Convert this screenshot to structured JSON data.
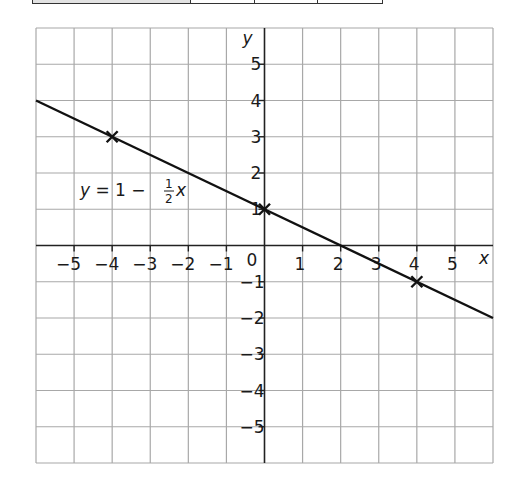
{
  "top_table": {
    "cells": [
      {
        "width": 159,
        "shaded": true
      },
      {
        "width": 64,
        "shaded": false
      },
      {
        "width": 64,
        "shaded": false
      },
      {
        "width": 64,
        "shaded": false
      }
    ]
  },
  "chart_data": {
    "type": "line",
    "title": "",
    "xlabel": "x",
    "ylabel": "y",
    "xlim": [
      -6,
      6
    ],
    "ylim": [
      -6,
      6
    ],
    "grid": true,
    "x_ticks": [
      -5,
      -4,
      -3,
      -2,
      -1,
      0,
      1,
      2,
      3,
      4,
      5
    ],
    "y_ticks": [
      -5,
      -4,
      -3,
      -2,
      -1,
      1,
      2,
      3,
      4,
      5
    ],
    "x_tick_labels": [
      "−5",
      "−4",
      "−3",
      "−2",
      "−1",
      "0",
      "1",
      "2",
      "3",
      "4",
      "5"
    ],
    "y_tick_labels": [
      "−5",
      "−4",
      "−3",
      "−2",
      "−1",
      "1",
      "2",
      "3",
      "4",
      "5"
    ],
    "series": [
      {
        "name": "y = 1 − ½x",
        "equation": "y = 1 - (1/2)x",
        "x": [
          -6,
          6
        ],
        "y": [
          4,
          -2
        ]
      }
    ],
    "marked_points": [
      {
        "x": -4,
        "y": 3,
        "marker": "x"
      },
      {
        "x": 0,
        "y": 1,
        "marker": "x"
      },
      {
        "x": 4,
        "y": -1,
        "marker": "x"
      }
    ],
    "annotations": [
      {
        "text": "y = 1 − ½x",
        "x": -5,
        "y": 1.5
      }
    ]
  },
  "labels": {
    "x_axis": "x",
    "y_axis": "y",
    "equation_prefix": "y",
    "equation_mid": " = 1 − ",
    "equation_num": "1",
    "equation_den": "2",
    "equation_var": "x"
  }
}
